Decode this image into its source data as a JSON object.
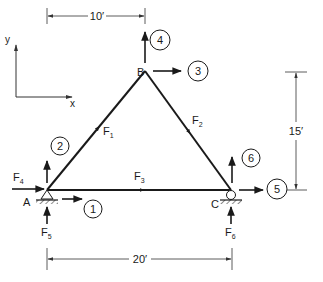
{
  "diagram": {
    "type": "plane truss free-body diagram",
    "axes": {
      "y_label": "y",
      "x_label": "x"
    },
    "nodes": [
      {
        "id": "A",
        "label": "A",
        "support": "pin"
      },
      {
        "id": "B",
        "label": "B",
        "support": "none"
      },
      {
        "id": "C",
        "label": "C",
        "support": "roller"
      }
    ],
    "members": [
      {
        "id": "F1",
        "label": "F",
        "sub": "1",
        "from": "A",
        "to": "B"
      },
      {
        "id": "F2",
        "label": "F",
        "sub": "2",
        "from": "B",
        "to": "C"
      },
      {
        "id": "F3",
        "label": "F",
        "sub": "3",
        "from": "A",
        "to": "C"
      }
    ],
    "reactions": [
      {
        "id": "F4",
        "label": "F",
        "sub": "4",
        "node": "A",
        "direction": "x"
      },
      {
        "id": "F5",
        "label": "F",
        "sub": "5",
        "node": "A",
        "direction": "y"
      },
      {
        "id": "F6",
        "label": "F",
        "sub": "6",
        "node": "C",
        "direction": "y"
      }
    ],
    "dof_markers": [
      {
        "num": "1",
        "node": "A",
        "direction": "x"
      },
      {
        "num": "2",
        "node": "A",
        "direction": "y"
      },
      {
        "num": "3",
        "node": "B",
        "direction": "x"
      },
      {
        "num": "4",
        "node": "B",
        "direction": "y"
      },
      {
        "num": "5",
        "node": "C",
        "direction": "x"
      },
      {
        "num": "6",
        "node": "C",
        "direction": "y"
      }
    ],
    "dimensions": {
      "top": "10′",
      "bottom": "20′",
      "right": "15′"
    }
  }
}
